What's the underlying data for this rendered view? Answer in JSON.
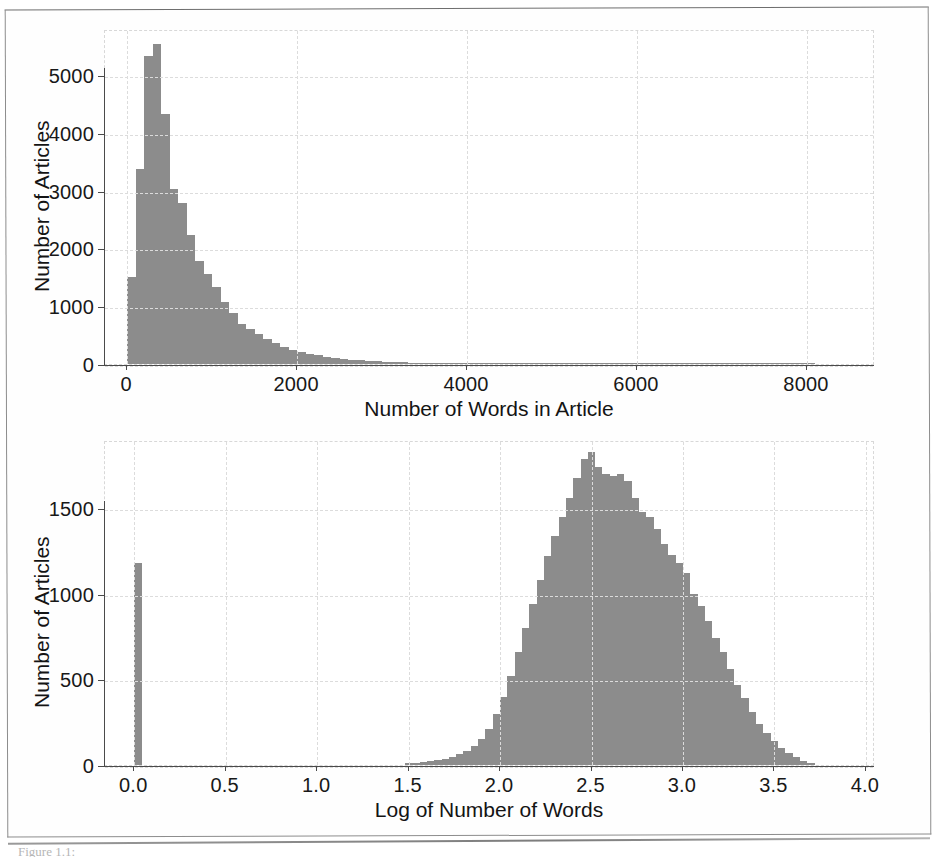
{
  "figure": {
    "caption_fragment": "Figure 1.1:",
    "bar_color": "#8c8c8c",
    "grid_color": "#dcdcdc",
    "axis_color": "#4a4a4a"
  },
  "chart_data": [
    {
      "type": "bar",
      "id": "words-histogram",
      "title": "",
      "xlabel": "Number of Words in Article",
      "ylabel": "Number of Articles",
      "xlim": [
        -260,
        8800
      ],
      "ylim": [
        0,
        5800
      ],
      "xticks": [
        0,
        2000,
        4000,
        6000,
        8000
      ],
      "xticklabels": [
        "0",
        "2000",
        "4000",
        "6000",
        "8000"
      ],
      "yticks": [
        0,
        1000,
        2000,
        3000,
        4000,
        5000
      ],
      "yticklabels": [
        "0",
        "1000",
        "2000",
        "3000",
        "4000",
        "5000"
      ],
      "grid": true,
      "legend": "none",
      "bin_width": 100,
      "bin_starts": [
        0,
        100,
        200,
        300,
        400,
        500,
        600,
        700,
        800,
        900,
        1000,
        1100,
        1200,
        1300,
        1400,
        1500,
        1600,
        1700,
        1800,
        1900,
        2000,
        2100,
        2200,
        2300,
        2400,
        2500,
        2600,
        2700,
        2800,
        2900,
        3000,
        3100,
        3200,
        3300,
        3400,
        3500,
        3600,
        3700,
        3800,
        3900,
        4000,
        4100,
        4200,
        4300,
        4400,
        4500,
        4600,
        4700,
        4800,
        4900,
        5000,
        5200,
        5400,
        5600,
        5800,
        6000,
        6400,
        6800,
        7200,
        7600,
        8000
      ],
      "values": [
        1510,
        3380,
        5330,
        5540,
        4320,
        3030,
        2790,
        2230,
        1780,
        1560,
        1330,
        1080,
        880,
        700,
        600,
        520,
        430,
        360,
        300,
        250,
        210,
        175,
        150,
        125,
        105,
        90,
        78,
        66,
        56,
        48,
        41,
        35,
        30,
        26,
        23,
        20,
        17,
        15,
        13,
        11,
        10,
        9,
        8,
        7,
        6,
        6,
        5,
        5,
        4,
        4,
        4,
        3,
        3,
        3,
        2,
        2,
        2,
        2,
        1,
        1,
        1
      ],
      "peak_value": 5540,
      "peak_bin": "300-400"
    },
    {
      "type": "bar",
      "id": "log-words-histogram",
      "title": "",
      "xlabel": "Log of Number of Words",
      "ylabel": "Number of Articles",
      "xlim": [
        -0.16,
        4.05
      ],
      "ylim": [
        0,
        1900
      ],
      "xticks": [
        0.0,
        0.5,
        1.0,
        1.5,
        2.0,
        2.5,
        3.0,
        3.5,
        4.0
      ],
      "xticklabels": [
        "0.0",
        "0.5",
        "1.0",
        "1.5",
        "2.0",
        "2.5",
        "3.0",
        "3.5",
        "4.0"
      ],
      "yticks": [
        0,
        500,
        1000,
        1500
      ],
      "yticklabels": [
        "0",
        "500",
        "1000",
        "1500"
      ],
      "grid": true,
      "legend": "none",
      "bin_width": 0.04,
      "bin_starts": [
        0.0,
        1.48,
        1.52,
        1.56,
        1.6,
        1.64,
        1.68,
        1.72,
        1.76,
        1.8,
        1.84,
        1.88,
        1.92,
        1.96,
        2.0,
        2.04,
        2.08,
        2.12,
        2.16,
        2.2,
        2.24,
        2.28,
        2.32,
        2.36,
        2.4,
        2.44,
        2.48,
        2.52,
        2.56,
        2.6,
        2.64,
        2.68,
        2.72,
        2.76,
        2.8,
        2.84,
        2.88,
        2.92,
        2.96,
        3.0,
        3.04,
        3.08,
        3.12,
        3.16,
        3.2,
        3.24,
        3.28,
        3.32,
        3.36,
        3.4,
        3.44,
        3.48,
        3.52,
        3.56,
        3.6,
        3.64,
        3.68
      ],
      "values": [
        1180,
        10,
        14,
        18,
        24,
        30,
        38,
        48,
        62,
        80,
        110,
        150,
        210,
        300,
        400,
        520,
        660,
        800,
        940,
        1080,
        1220,
        1340,
        1450,
        1560,
        1680,
        1790,
        1830,
        1740,
        1700,
        1690,
        1700,
        1660,
        1560,
        1480,
        1450,
        1380,
        1290,
        1230,
        1180,
        1120,
        1000,
        930,
        840,
        740,
        660,
        560,
        470,
        390,
        310,
        240,
        185,
        140,
        100,
        70,
        45,
        25,
        12
      ],
      "peak_value": 1830,
      "peak_bin": "2.48-2.52",
      "zero_spike_value": 1180
    }
  ]
}
